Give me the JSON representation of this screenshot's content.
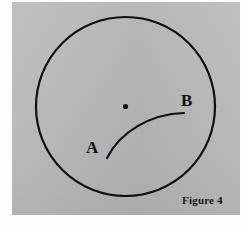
{
  "figure": {
    "caption": "Figure 4",
    "background_color": "#b9b9b9",
    "ink_color": "#101010",
    "page_color": "#fdfdfd",
    "labels": {
      "point_a": "A",
      "point_b": "B"
    },
    "geometry": {
      "circle": {
        "center_x": 125.5,
        "center_y": 106.5,
        "radius": 89.5,
        "stroke_width": 2.2
      },
      "center_dot": {
        "x": 125.5,
        "y": 106.5,
        "radius": 2.6
      },
      "arc": {
        "start_x": 107,
        "start_y": 158,
        "end_x": 184,
        "end_y": 113,
        "control1_x": 120,
        "control1_y": 132,
        "control2_x": 150,
        "control2_y": 114,
        "stroke_width": 2.2
      }
    }
  }
}
